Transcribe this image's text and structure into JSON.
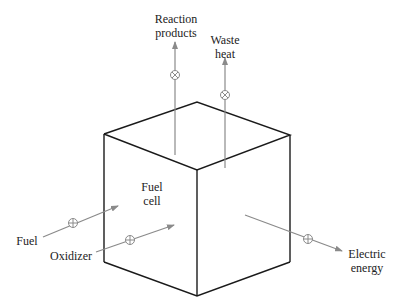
{
  "diagram": {
    "center_label": [
      "Fuel",
      "cell"
    ],
    "inputs": [
      {
        "label": "Fuel"
      },
      {
        "label": "Oxidizer"
      }
    ],
    "outputs": [
      {
        "label": [
          "Reaction",
          "products"
        ]
      },
      {
        "label": [
          "Waste",
          "heat"
        ]
      },
      {
        "label": [
          "Electric",
          "energy"
        ]
      }
    ],
    "colors": {
      "cube_edge": "#1a1a1a",
      "flow_arrow": "#8a8a8a",
      "text": "#222222"
    }
  }
}
